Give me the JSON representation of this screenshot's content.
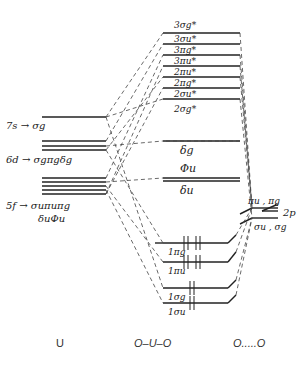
{
  "diagram": {
    "type": "molecular-orbital-diagram",
    "columns": {
      "left": "U",
      "center": "O–U–O",
      "right": "O.....O"
    },
    "uranium_levels": {
      "s7": "7s → σg",
      "d6_line1": "6d → σgπgδg",
      "f5_line1": "5f → σuπuπg",
      "f5_line2": "δuΦu"
    },
    "molecular_levels_upper": [
      "3σg*",
      "3σu*",
      "3πg*",
      "3πu*",
      "2πu*",
      "2πg*",
      "2σu*",
      "2σg*"
    ],
    "molecular_levels_nonbonding": [
      "δg",
      "Φu",
      "δu"
    ],
    "molecular_levels_bonding": [
      "1πg",
      "1πu",
      "1σg",
      "1σu"
    ],
    "oxygen_levels": {
      "upper": "πu , πg",
      "lower": "σu , σg",
      "orbital": "2p"
    },
    "electron_occupancy": {
      "1πg": "↑↓ ↑↓",
      "1πu": "↑↓ ↑↓",
      "1σg": "↑↓",
      "1σu": "↑↓"
    }
  }
}
